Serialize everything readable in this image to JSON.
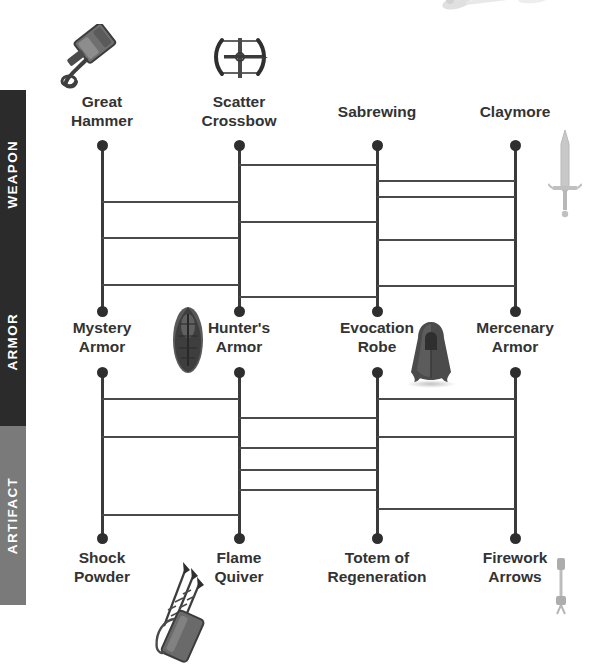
{
  "diagram": {
    "type": "ghost-leg-ladder",
    "columns": 4,
    "rows": 2,
    "colors": {
      "band_weapon": "#2b2b2b",
      "band_armor": "#2b2b2b",
      "band_artifact": "#7a7a7a",
      "node": "#2e2e2e",
      "rail": "#3a3a3a",
      "rung": "#4a4a4a",
      "label_text": "#333333",
      "band_text": "#ffffff",
      "background": "#ffffff"
    }
  },
  "bands": [
    {
      "label": "WEAPON",
      "color": "#2b2b2b",
      "top": 90,
      "height": 168
    },
    {
      "label": "ARMOR",
      "color": "#2b2b2b",
      "top": 258,
      "height": 168
    },
    {
      "label": "ARTIFACT",
      "color": "#7a7a7a",
      "top": 426,
      "height": 179
    }
  ],
  "tiers": [
    {
      "name": "weapon-row",
      "labels": [
        {
          "text": "Great\nHammer",
          "icon": "war-hammer-icon"
        },
        {
          "text": "Scatter\nCrossbow",
          "icon": "crossbow-icon"
        },
        {
          "text": "Sabrewing",
          "icon": null
        },
        {
          "text": "Claymore",
          "icon": "greatsword-icon"
        }
      ]
    },
    {
      "name": "armor-row",
      "labels": [
        {
          "text": "Mystery\nArmor",
          "icon": null
        },
        {
          "text": "Hunter's\nArmor",
          "icon": "cloak-armor-icon"
        },
        {
          "text": "Evocation\nRobe",
          "icon": "robe-icon"
        },
        {
          "text": "Mercenary\nArmor",
          "icon": null
        }
      ]
    },
    {
      "name": "artifact-row",
      "labels": [
        {
          "text": "Shock\nPowder",
          "icon": null
        },
        {
          "text": "Flame\nQuiver",
          "icon": "arrow-quiver-icon"
        },
        {
          "text": "Totem of\nRegeneration",
          "icon": null
        },
        {
          "text": "Firework\nArrows",
          "icon": "firework-arrow-icon"
        }
      ]
    }
  ],
  "ladder_upper": {
    "name": "weapon-to-armor-ladder",
    "top": 145,
    "bottom": 311,
    "columns_x": [
      102,
      239,
      377,
      515
    ],
    "rungs": [
      {
        "from": 0,
        "to": 1,
        "y": 201
      },
      {
        "from": 0,
        "to": 1,
        "y": 237
      },
      {
        "from": 0,
        "to": 1,
        "y": 284
      },
      {
        "from": 1,
        "to": 2,
        "y": 164
      },
      {
        "from": 1,
        "to": 2,
        "y": 221
      },
      {
        "from": 1,
        "to": 2,
        "y": 296
      },
      {
        "from": 2,
        "to": 3,
        "y": 180
      },
      {
        "from": 2,
        "to": 3,
        "y": 196
      },
      {
        "from": 2,
        "to": 3,
        "y": 239
      },
      {
        "from": 2,
        "to": 3,
        "y": 285
      }
    ]
  },
  "ladder_lower": {
    "name": "armor-to-artifact-ladder",
    "top": 372,
    "bottom": 538,
    "columns_x": [
      102,
      239,
      377,
      515
    ],
    "rungs": [
      {
        "from": 0,
        "to": 1,
        "y": 398
      },
      {
        "from": 0,
        "to": 1,
        "y": 436
      },
      {
        "from": 0,
        "to": 1,
        "y": 514
      },
      {
        "from": 1,
        "to": 2,
        "y": 417
      },
      {
        "from": 1,
        "to": 2,
        "y": 447
      },
      {
        "from": 1,
        "to": 2,
        "y": 469
      },
      {
        "from": 1,
        "to": 2,
        "y": 489
      },
      {
        "from": 2,
        "to": 3,
        "y": 398
      },
      {
        "from": 2,
        "to": 3,
        "y": 436
      },
      {
        "from": 2,
        "to": 3,
        "y": 508
      }
    ]
  },
  "icons": [
    {
      "name": "war-hammer-icon",
      "x": 55,
      "y": 26,
      "w": 78,
      "h": 60
    },
    {
      "name": "crossbow-icon",
      "x": 212,
      "y": 34,
      "w": 56,
      "h": 50
    },
    {
      "name": "greatsword-icon",
      "x": 548,
      "y": 132,
      "w": 30,
      "h": 88
    },
    {
      "name": "cloak-armor-icon",
      "x": 168,
      "y": 302,
      "w": 38,
      "h": 68
    },
    {
      "name": "robe-icon",
      "x": 404,
      "y": 322,
      "w": 52,
      "h": 62
    },
    {
      "name": "arrow-quiver-icon",
      "x": 140,
      "y": 556,
      "w": 78,
      "h": 108
    },
    {
      "name": "firework-arrow-icon",
      "x": 552,
      "y": 560,
      "w": 16,
      "h": 52
    },
    {
      "name": "faded-weapon-icon",
      "x": 438,
      "y": 0,
      "w": 100,
      "h": 22
    }
  ]
}
